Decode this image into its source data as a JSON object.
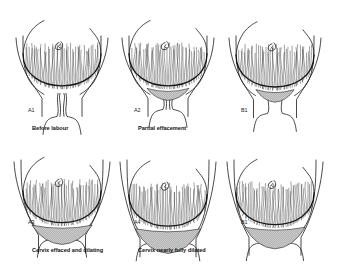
{
  "figure": {
    "panels": [
      {
        "id": "A1",
        "label": "A1",
        "caption": "Before labour",
        "row": "top",
        "col": 0,
        "effacement": 0.0,
        "dilation": 0.0
      },
      {
        "id": "A2",
        "label": "A2",
        "caption": "Partial effacement",
        "row": "top",
        "col": 1,
        "effacement": 0.5,
        "dilation": 0.0
      },
      {
        "id": "B1-top",
        "label": "B1",
        "caption": "",
        "row": "top",
        "col": 2,
        "effacement": 0.3,
        "dilation": 0.15
      },
      {
        "id": "A3",
        "label": "A3",
        "caption": "Cervix effaced and dilating",
        "row": "bottom",
        "col": 0,
        "effacement": 1.0,
        "dilation": 0.35
      },
      {
        "id": "A4",
        "label": "A4",
        "caption": "Cervix nearly fully dilated",
        "row": "bottom",
        "col": 1,
        "effacement": 1.0,
        "dilation": 0.8
      },
      {
        "id": "B1-bottom",
        "label": "B1",
        "caption": "",
        "row": "bottom",
        "col": 2,
        "effacement": 0.9,
        "dilation": 0.6
      }
    ]
  },
  "colors": {
    "ink": "#1a1a1a",
    "background": "#ffffff"
  }
}
